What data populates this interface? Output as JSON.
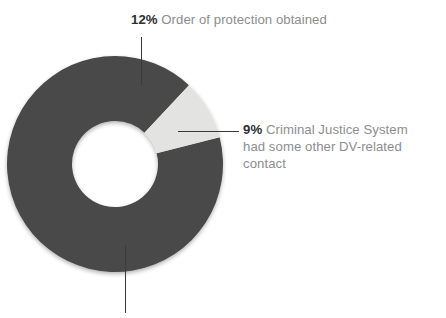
{
  "chart_data": {
    "type": "pie",
    "variant": "donut",
    "title": "",
    "subtitle": "",
    "xlabel": "",
    "ylabel": "",
    "legend_position": "callout-labels",
    "grid": false,
    "units": "percent",
    "start_angle_deg": 0,
    "direction": "clockwise",
    "categories": [
      "Order of protection obtained",
      "Criminal Justice System had some other DV-related contact",
      "Remainder"
    ],
    "values": [
      12,
      9,
      79
    ],
    "colors": [
      "#484849",
      "#e3e3e1",
      "#484849"
    ],
    "slices": [
      {
        "label": "Order of protection obtained",
        "value": 12,
        "value_text": "12%",
        "color": "#484849",
        "start_deg": 0,
        "end_deg": 43.2,
        "has_callout": true
      },
      {
        "label": "Criminal Justice System had some other DV-related contact",
        "value": 9,
        "value_text": "9%",
        "color": "#e3e3e1",
        "start_deg": 43.2,
        "end_deg": 75.6,
        "has_callout": true
      },
      {
        "label": "",
        "value": 79,
        "value_text": "",
        "color": "#484849",
        "start_deg": 75.6,
        "end_deg": 360,
        "has_callout": true,
        "callout_label_cropped": true
      }
    ]
  },
  "callouts": {
    "top": {
      "percent": "12%",
      "description": "Order of protection obtained"
    },
    "right": {
      "percent": "9%",
      "description": "Criminal Justice System had some other DV-related contact"
    }
  },
  "colors": {
    "slice_dark": "#484849",
    "slice_light": "#e3e3e1",
    "leader_line": "#3a3a3c",
    "percent_text": "#2e2e30",
    "description_text": "#8d8d8f",
    "background": "#ffffff"
  },
  "geometry": {
    "center_x": 115,
    "center_y": 164,
    "outer_radius": 108,
    "inner_radius": 43
  }
}
